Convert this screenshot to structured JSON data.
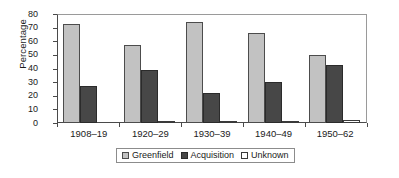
{
  "chart_data": {
    "type": "bar",
    "title": "",
    "xlabel": "",
    "ylabel": "Percentage",
    "ylim": [
      0,
      80
    ],
    "yticks": [
      0,
      10,
      20,
      30,
      40,
      50,
      60,
      70,
      80
    ],
    "grid": false,
    "legend_position": "bottom",
    "categories": [
      "1908–19",
      "1920–29",
      "1930–39",
      "1940–49",
      "1950–62"
    ],
    "series": [
      {
        "name": "Greenfield",
        "color": "#c2c2c2",
        "values": [
          73,
          57,
          74,
          66,
          50
        ]
      },
      {
        "name": "Acquisition",
        "color": "#474747",
        "values": [
          27,
          39,
          22,
          30,
          42.5
        ]
      },
      {
        "name": "Unknown",
        "color": "#ffffff",
        "values": [
          0,
          1.5,
          1.5,
          1,
          2.5
        ]
      }
    ]
  },
  "axis": {
    "y_title": "Percentage",
    "y_tick_labels": [
      "80",
      "70",
      "60",
      "50",
      "40",
      "30",
      "20",
      "10",
      "0"
    ],
    "x_tick_labels": [
      "1908–19",
      "1920–29",
      "1930–39",
      "1940–49",
      "1950–62"
    ]
  },
  "legend": {
    "items": [
      {
        "label": "Greenfield"
      },
      {
        "label": "Acquisition"
      },
      {
        "label": "Unknown"
      }
    ]
  },
  "colors": {
    "greenfield": "#c2c2c2",
    "acquisition": "#474747",
    "unknown": "#ffffff",
    "axis": "#4a4a4a",
    "text": "#1a1a1a"
  }
}
